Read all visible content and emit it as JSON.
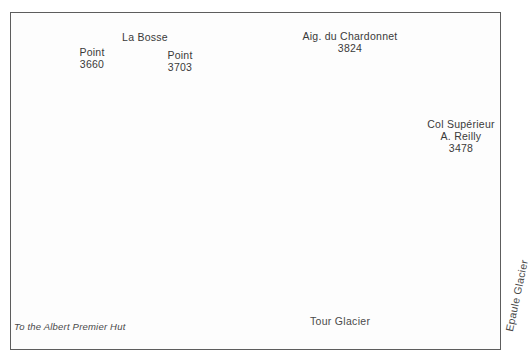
{
  "figure": {
    "type": "mountaineering-route-topo",
    "medium": "pen-and-ink panorama drawing",
    "background_color": "#fdfdfd",
    "frame_color": "#5d5d5d",
    "ink_color": "#2b2b2b",
    "route_color": "#8a8a8a"
  },
  "summit_labels": [
    {
      "name": "point-3660",
      "line1": "Point",
      "line2": "3660",
      "x": 62,
      "y": 47,
      "w": 60,
      "leader": {
        "x": 122,
        "y": 62,
        "len": 34
      }
    },
    {
      "name": "la-bosse",
      "line1": "La Bosse",
      "line2": "",
      "x": 104,
      "y": 32,
      "w": 82,
      "leader": {
        "x": 167,
        "y": 46,
        "len": 42
      }
    },
    {
      "name": "point-3703",
      "line1": "Point",
      "line2": "3703",
      "x": 150,
      "y": 50,
      "w": 60,
      "leader": {
        "x": 196,
        "y": 62,
        "len": 28
      }
    },
    {
      "name": "aiguille-du-chardonnet",
      "line1": "Aig. du Chardonnet",
      "line2": "3824",
      "x": 287,
      "y": 30,
      "w": 126,
      "leader": {
        "x": 320,
        "y": 54,
        "len": 22
      }
    }
  ],
  "col_label": {
    "name": "col-superieur-a-reilly",
    "line1": "Col Supérieur",
    "line2": "A. Reilly",
    "line3": "3478",
    "x": 409,
    "y": 118,
    "w": 104,
    "leader": {
      "x": 466,
      "y": 157,
      "len": 32
    }
  },
  "glacier_labels": [
    {
      "name": "tour-glacier",
      "text": "Tour Glacier",
      "x": 310,
      "y": 322,
      "rotated": false
    },
    {
      "name": "epaule-glacier",
      "text": "Epaule Glacier",
      "x": 503,
      "y": 330,
      "rotated": true
    }
  ],
  "route_note": {
    "name": "to-the-albert-premier-hut",
    "text": "To the Albert Premier Hut",
    "x": 14,
    "y": 325
  },
  "route": {
    "name": "descent-route",
    "description": "grey route line from the ridge near La Bosse down the glacier, around the lower basin and out left toward the hut; second branch descends from the Col Supérieur A. Reilly"
  }
}
